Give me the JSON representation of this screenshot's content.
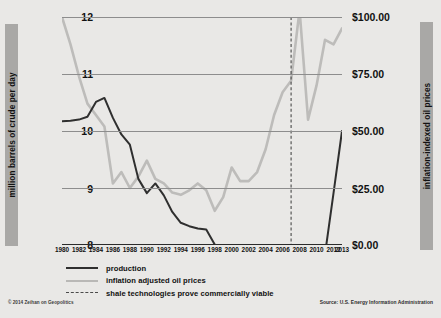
{
  "axes": {
    "left_label": "million barrels of crude per day",
    "right_label": "inflation-indexed oil prices",
    "left_ticks": [
      "12",
      "11",
      "10",
      "9",
      "8"
    ],
    "right_ticks": [
      "$100.00",
      "$75.00",
      "$50.00",
      "$25.00",
      "$0.00"
    ]
  },
  "legend": {
    "production": "production",
    "prices": "inflation adjusted oil prices",
    "shale": "shale technologies prove commercially viable"
  },
  "footer": {
    "credit": "© 2014 Zeihan on Geopolitics",
    "source": "Source: U.S. Energy Information Administration"
  },
  "colors": {
    "background": "#e9e8e6",
    "production_line": "#2f2f2f",
    "price_line": "#bdbcba",
    "gridline": "#8d8d8d",
    "axis": "#2b2b2b",
    "marker_line": "#4a4a4a",
    "axis_bar": "#a9a8a6"
  },
  "chart_data": {
    "type": "line",
    "title": "",
    "xlabel": "",
    "ylabel": "million barrels of crude per day",
    "y2label": "inflation-indexed oil prices",
    "grid": true,
    "legend_position": "below",
    "x": [
      1980,
      1981,
      1982,
      1983,
      1984,
      1985,
      1986,
      1987,
      1988,
      1989,
      1990,
      1991,
      1992,
      1993,
      1994,
      1995,
      1996,
      1997,
      1998,
      1999,
      2000,
      2001,
      2002,
      2003,
      2004,
      2005,
      2006,
      2007,
      2008,
      2009,
      2010,
      2011,
      2012,
      2013
    ],
    "xticks": [
      1980,
      1982,
      1984,
      1986,
      1988,
      1990,
      1992,
      1994,
      1996,
      1998,
      2000,
      2002,
      2004,
      2006,
      2008,
      2010,
      2012,
      2013
    ],
    "ylim": [
      8,
      12
    ],
    "y2lim": [
      0,
      100
    ],
    "yticks": [
      8,
      9,
      10,
      11,
      12
    ],
    "y2ticks": [
      0,
      25,
      50,
      75,
      100
    ],
    "series": [
      {
        "name": "production",
        "axis": "left",
        "units": "million barrels of crude per day",
        "color": "#2f2f2f",
        "values": [
          10.17,
          10.18,
          10.2,
          10.25,
          10.51,
          10.58,
          10.23,
          9.94,
          9.76,
          9.16,
          8.91,
          9.08,
          8.87,
          8.58,
          8.39,
          8.33,
          8.29,
          8.27,
          8.01,
          7.73,
          7.73,
          7.67,
          7.63,
          7.4,
          7.23,
          6.9,
          6.84,
          6.86,
          6.73,
          7.27,
          7.55,
          7.84,
          8.91,
          10.0
        ]
      },
      {
        "name": "inflation adjusted oil prices",
        "axis": "right",
        "units": "USD per barrel, inflation-indexed",
        "color": "#bdbcba",
        "values": [
          100.0,
          88.0,
          74.0,
          62.0,
          57.0,
          52.0,
          27.0,
          32.0,
          25.0,
          30.0,
          37.0,
          29.0,
          27.0,
          23.0,
          22.0,
          24.0,
          27.0,
          24.0,
          15.0,
          21.0,
          34.0,
          28.0,
          28.0,
          32.0,
          42.0,
          57.0,
          67.0,
          72.0,
          103.0,
          55.0,
          70.0,
          90.0,
          88.0,
          95.0
        ]
      }
    ],
    "annotations": [
      {
        "type": "vline",
        "x": 2007,
        "style": "dashed",
        "label": "shale technologies prove commercially viable"
      }
    ]
  }
}
